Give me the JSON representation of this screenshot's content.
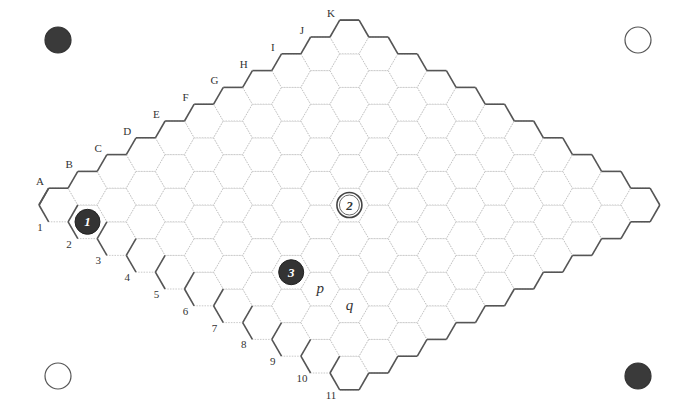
{
  "board": {
    "size": 11,
    "origin": [
      58.4,
      205
    ],
    "side": 19.4,
    "column_labels": [
      "A",
      "B",
      "C",
      "D",
      "E",
      "F",
      "G",
      "H",
      "I",
      "J",
      "K"
    ],
    "row_labels": [
      "1",
      "2",
      "3",
      "4",
      "5",
      "6",
      "7",
      "8",
      "9",
      "10",
      "11"
    ],
    "cell_line_color": "#bbbbbb",
    "border_color": "#555555"
  },
  "stones": [
    {
      "cell": "A2",
      "col": 0,
      "row": 1,
      "color": "black",
      "label": "1"
    },
    {
      "cell": "F6",
      "col": 5,
      "row": 5,
      "color": "white",
      "label": "2"
    },
    {
      "cell": "C7",
      "col": 2,
      "row": 6,
      "color": "black",
      "label": "3"
    }
  ],
  "marks": [
    {
      "cell": "C8",
      "col": 2,
      "row": 7,
      "label": "p"
    },
    {
      "cell": "C9",
      "col": 2,
      "row": 8,
      "label": "q"
    }
  ],
  "corner_discs": [
    {
      "position": "top-left",
      "x": 58,
      "y": 40,
      "color": "black"
    },
    {
      "position": "top-right",
      "x": 638,
      "y": 40,
      "color": "white"
    },
    {
      "position": "bottom-left",
      "x": 58,
      "y": 376,
      "color": "white"
    },
    {
      "position": "bottom-right",
      "x": 638,
      "y": 376,
      "color": "black"
    }
  ]
}
